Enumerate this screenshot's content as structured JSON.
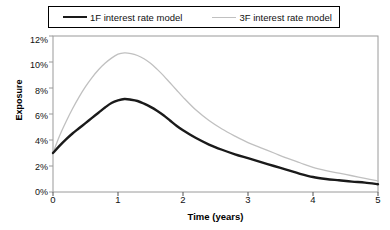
{
  "legend": {
    "position": "top-center",
    "border": true,
    "entries": [
      {
        "label": "1F interest rate model",
        "color": "#1a1a1a",
        "style": "thick"
      },
      {
        "label": "3F interest rate model",
        "color": "#c0c0c0",
        "style": "thin"
      }
    ]
  },
  "axes": {
    "ylabel": "Exposure",
    "xlabel": "Time (years)",
    "yticks": [
      "0%",
      "2%",
      "4%",
      "6%",
      "8%",
      "10%",
      "12%"
    ],
    "xticks": [
      "0",
      "1",
      "2",
      "3",
      "4",
      "5"
    ]
  },
  "chart_data": {
    "type": "line",
    "title": "",
    "subtitle": "",
    "xlabel": "Time (years)",
    "ylabel": "Exposure",
    "xlim": [
      0,
      5
    ],
    "ylim": [
      0,
      12
    ],
    "ytick_values": [
      0,
      2,
      4,
      6,
      8,
      10,
      12
    ],
    "ytick_labels": [
      "0%",
      "2%",
      "4%",
      "6%",
      "8%",
      "10%",
      "12%"
    ],
    "xtick_values": [
      0,
      1,
      2,
      3,
      4,
      5
    ],
    "xtick_labels": [
      "0",
      "1",
      "2",
      "3",
      "4",
      "5"
    ],
    "grid": false,
    "legend_position": "top-center",
    "y_unit": "percent",
    "x": [
      0,
      0.1,
      0.2,
      0.3,
      0.4,
      0.5,
      0.6,
      0.7,
      0.8,
      0.9,
      1.0,
      1.1,
      1.2,
      1.3,
      1.4,
      1.5,
      1.6,
      1.7,
      1.8,
      1.9,
      2.0,
      2.2,
      2.4,
      2.6,
      2.8,
      3.0,
      3.2,
      3.4,
      3.6,
      3.8,
      4.0,
      4.2,
      4.4,
      4.6,
      4.8,
      5.0
    ],
    "series": [
      {
        "name": "1F interest rate model",
        "color": "#1a1a1a",
        "linewidth": 2.4,
        "values": [
          3.0,
          3.55,
          4.05,
          4.5,
          4.9,
          5.3,
          5.7,
          6.1,
          6.5,
          6.85,
          7.05,
          7.15,
          7.1,
          7.0,
          6.8,
          6.55,
          6.25,
          5.9,
          5.5,
          5.1,
          4.75,
          4.15,
          3.65,
          3.25,
          2.9,
          2.6,
          2.3,
          2.0,
          1.7,
          1.4,
          1.15,
          1.0,
          0.9,
          0.8,
          0.72,
          0.6
        ]
      },
      {
        "name": "3F interest rate model",
        "color": "#c0c0c0",
        "linewidth": 1.3,
        "values": [
          3.0,
          4.3,
          5.4,
          6.4,
          7.3,
          8.1,
          8.8,
          9.4,
          9.9,
          10.3,
          10.6,
          10.7,
          10.65,
          10.5,
          10.25,
          9.9,
          9.45,
          8.95,
          8.4,
          7.85,
          7.3,
          6.3,
          5.5,
          4.85,
          4.3,
          3.8,
          3.4,
          3.0,
          2.6,
          2.25,
          1.9,
          1.65,
          1.45,
          1.25,
          1.05,
          0.85
        ]
      }
    ]
  }
}
